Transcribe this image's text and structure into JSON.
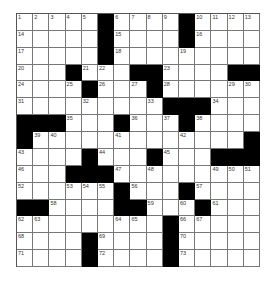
{
  "puzzle": {
    "rows": 15,
    "cols": 15,
    "grid": [
      [
        "1",
        "2",
        "3",
        "4",
        "5",
        "#",
        "6",
        "7",
        "8",
        "9",
        "#",
        "10",
        "11",
        "12",
        "13"
      ],
      [
        "14",
        "",
        "",
        "",
        "",
        "#",
        "15",
        "",
        "",
        "",
        "#",
        "16",
        "",
        "",
        ""
      ],
      [
        "17",
        "",
        "",
        "",
        "",
        "#",
        "18",
        "",
        "",
        "",
        "19",
        "",
        "",
        "",
        ""
      ],
      [
        "20",
        "",
        "",
        "#",
        "21",
        "22",
        "",
        "#",
        "#",
        "23",
        "",
        "",
        "",
        "#",
        "#"
      ],
      [
        "24",
        "",
        "",
        "25",
        "#",
        "26",
        "",
        "27",
        "#",
        "28",
        "",
        "",
        "",
        "29",
        "30"
      ],
      [
        "31",
        "",
        "",
        "",
        "32",
        "",
        "",
        "",
        "33",
        "#",
        "#",
        "#",
        "34",
        "",
        ""
      ],
      [
        "#",
        "#",
        "#",
        "35",
        "",
        "",
        "#",
        "36",
        "",
        "37",
        "#",
        "38",
        "",
        "",
        ""
      ],
      [
        "#",
        "39",
        "40",
        "",
        "",
        "",
        "41",
        "",
        "",
        "",
        "42",
        "",
        "",
        "",
        "#"
      ],
      [
        "43",
        "",
        "",
        "",
        "#",
        "44",
        "",
        "",
        "#",
        "45",
        "",
        "",
        "#",
        "#",
        "#"
      ],
      [
        "46",
        "",
        "",
        "#",
        "#",
        "#",
        "47",
        "",
        "48",
        "",
        "",
        "",
        "49",
        "50",
        "51"
      ],
      [
        "52",
        "",
        "",
        "53",
        "54",
        "55",
        "#",
        "56",
        "",
        "",
        "#",
        "57",
        "",
        "",
        ""
      ],
      [
        "#",
        "#",
        "58",
        "",
        "",
        "",
        "#",
        "#",
        "59",
        "",
        "60",
        "#",
        "61",
        "",
        ""
      ],
      [
        "62",
        "63",
        "",
        "",
        "",
        "",
        "64",
        "65",
        "",
        "#",
        "66",
        "67",
        "",
        "",
        ""
      ],
      [
        "68",
        "",
        "",
        "",
        "#",
        "69",
        "",
        "",
        "",
        "#",
        "70",
        "",
        "",
        "",
        ""
      ],
      [
        "71",
        "",
        "",
        "",
        "#",
        "72",
        "",
        "",
        "",
        "#",
        "73",
        "",
        "",
        "",
        ""
      ]
    ]
  }
}
